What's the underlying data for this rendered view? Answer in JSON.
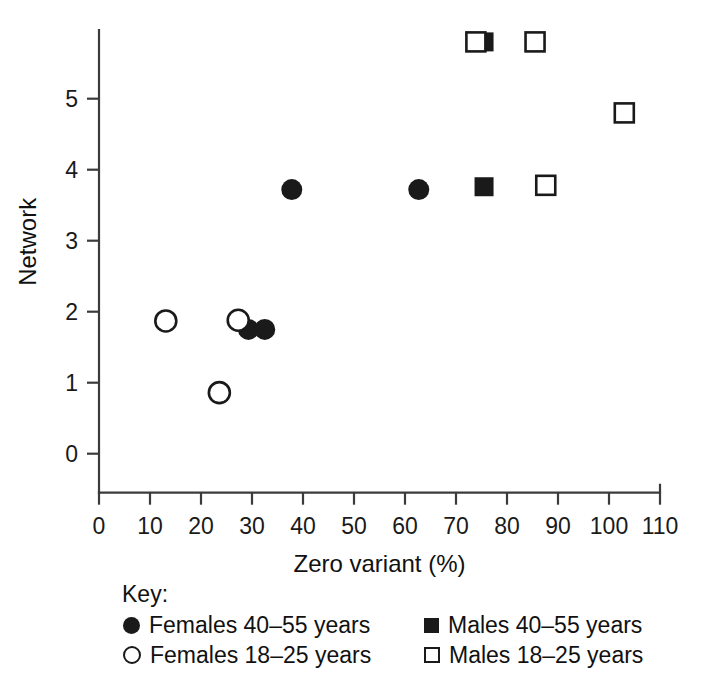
{
  "chart_data": {
    "type": "scatter",
    "title": "",
    "xlabel": "Zero variant (%)",
    "ylabel": "Network",
    "xlim": [
      0,
      110
    ],
    "ylim": [
      0,
      5.95
    ],
    "xticks": [
      0,
      10,
      20,
      30,
      40,
      50,
      60,
      70,
      80,
      90,
      100,
      110
    ],
    "yticks": [
      0,
      1,
      2,
      3,
      4,
      5
    ],
    "grid": false,
    "legend_position": "below-axes",
    "legend_title": "Key:",
    "series": [
      {
        "name": "Females 40-55 years",
        "marker": "filled-circle",
        "color": "#1a1a1a",
        "points": [
          {
            "x": 29.3,
            "y": 1.75
          },
          {
            "x": 32.5,
            "y": 1.75
          },
          {
            "x": 37.8,
            "y": 3.72
          },
          {
            "x": 62.7,
            "y": 3.72
          }
        ]
      },
      {
        "name": "Females 18-25 years",
        "marker": "open-circle",
        "color": "#1a1a1a",
        "points": [
          {
            "x": 13.1,
            "y": 1.87
          },
          {
            "x": 23.6,
            "y": 0.86
          },
          {
            "x": 27.3,
            "y": 1.88
          }
        ]
      },
      {
        "name": "Males 40-55 years",
        "marker": "filled-square",
        "color": "#1a1a1a",
        "points": [
          {
            "x": 75.5,
            "y": 3.76
          },
          {
            "x": 75.5,
            "y": 5.8
          }
        ]
      },
      {
        "name": "Males 18-25 years",
        "marker": "open-square",
        "color": "#1a1a1a",
        "points": [
          {
            "x": 73.9,
            "y": 5.8
          },
          {
            "x": 85.5,
            "y": 5.8
          },
          {
            "x": 87.6,
            "y": 3.78
          },
          {
            "x": 103.0,
            "y": 4.8
          }
        ]
      }
    ]
  },
  "legend": {
    "title": "Key:",
    "entries": [
      {
        "marker": "filled-circle",
        "label": "Females 40–55 years"
      },
      {
        "marker": "filled-square",
        "label": "Males 40–55 years"
      },
      {
        "marker": "open-circle",
        "label": "Females 18–25 years"
      },
      {
        "marker": "open-square",
        "label": "Males 18–25 years"
      }
    ]
  }
}
